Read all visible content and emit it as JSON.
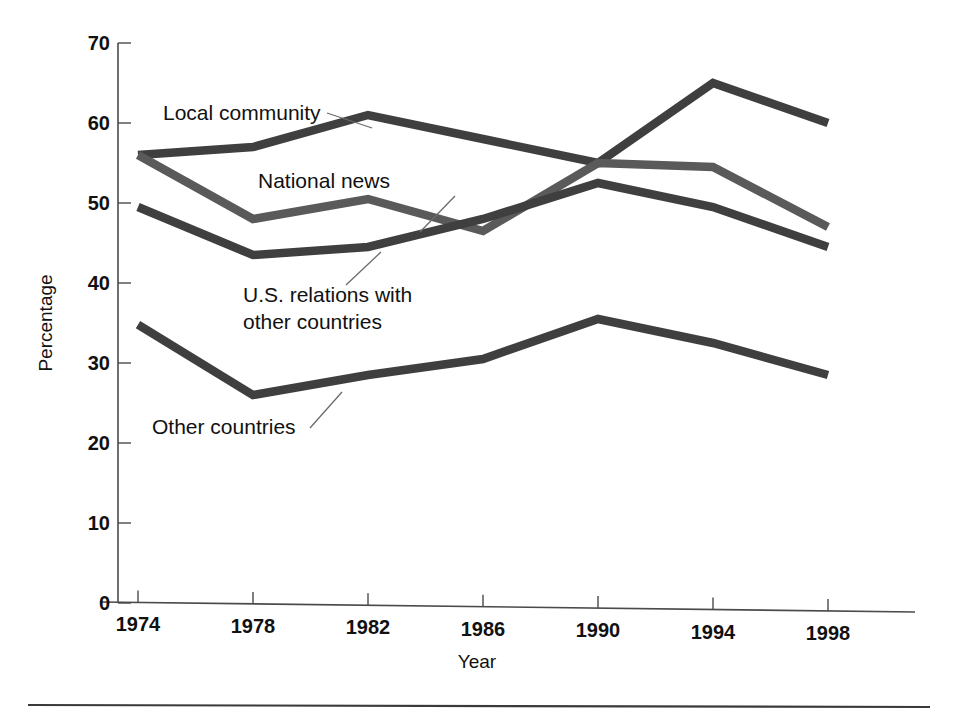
{
  "chart_data": {
    "type": "line",
    "title": "",
    "xlabel": "Year",
    "ylabel": "Percentage",
    "categories": [
      1974,
      1978,
      1982,
      1986,
      1990,
      1994,
      1998
    ],
    "tick_labels_x": [
      "1974",
      "1978",
      "1982",
      "1986",
      "1990",
      "1994",
      "1998"
    ],
    "tick_labels_y": [
      "0",
      "10",
      "20",
      "30",
      "40",
      "50",
      "60",
      "70"
    ],
    "yticks": [
      0,
      10,
      20,
      30,
      40,
      50,
      60,
      70
    ],
    "ylim": [
      0,
      70
    ],
    "grid": false,
    "legend_position": "inline-annotations",
    "series": [
      {
        "name": "Local community",
        "color": "#3f3f3f",
        "values": [
          56.0,
          57.0,
          61.0,
          58.0,
          55.0,
          65.0,
          60.0
        ]
      },
      {
        "name": "National news",
        "color": "#5a5a5a",
        "values": [
          56.0,
          48.0,
          50.5,
          46.5,
          55.0,
          54.5,
          47.0
        ]
      },
      {
        "name": "U.S. relations with other countries",
        "color": "#3f3f3f",
        "values": [
          49.5,
          43.5,
          44.5,
          48.0,
          52.5,
          49.5,
          44.5
        ]
      },
      {
        "name": "Other countries",
        "color": "#3f3f3f",
        "values": [
          34.8,
          26.0,
          28.5,
          30.5,
          35.5,
          32.5,
          28.5
        ]
      }
    ],
    "annotations": [
      {
        "label": "Local community",
        "lines": [
          "Local community"
        ],
        "text_x": 163,
        "text_y": 120,
        "leader": [
          [
            327,
            113
          ],
          [
            372,
            128
          ]
        ]
      },
      {
        "label": "National news",
        "lines": [
          "National news"
        ],
        "text_x": 258,
        "text_y": 188,
        "leader": [
          [
            455,
            196
          ],
          [
            420,
            232
          ]
        ]
      },
      {
        "label": "U.S. relations with other countries",
        "lines": [
          "U.S. relations with",
          "other countries"
        ],
        "text_x": 243,
        "text_y": 302,
        "leader": [
          [
            346,
            285
          ],
          [
            381,
            252
          ]
        ]
      },
      {
        "label": "Other countries",
        "lines": [
          "Other countries"
        ],
        "text_x": 152,
        "text_y": 434,
        "leader": [
          [
            310,
            428
          ],
          [
            342,
            392
          ]
        ]
      }
    ]
  }
}
